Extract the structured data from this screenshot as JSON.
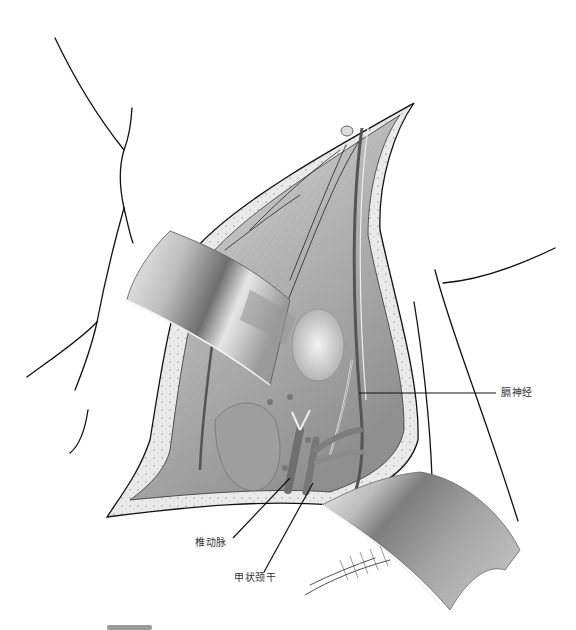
{
  "figure": {
    "labels": [
      {
        "id": "phrenic-nerve",
        "text": "膈神经",
        "x": 501,
        "y": 389
      },
      {
        "id": "vertebral-artery",
        "text": "椎动脉",
        "x": 195,
        "y": 538
      },
      {
        "id": "thyrocervical-trunk",
        "text": "甲状颈干",
        "x": 238,
        "y": 572
      }
    ],
    "colors": {
      "line": "#111111",
      "retractor_dark": "#7a7a7a",
      "retractor_light": "#d8d8d8",
      "tissue": "#c9c9c9",
      "skin_edge": "#eeeeee",
      "label_text": "#333333"
    }
  }
}
